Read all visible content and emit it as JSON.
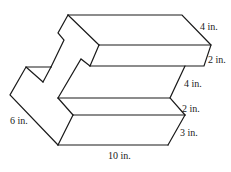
{
  "figure": {
    "labels": {
      "top_depth": "4 in.",
      "top_bar_height": "2 in.",
      "gap_height": "4 in.",
      "middle_ledge_height": "2 in.",
      "bottom_height": "3 in.",
      "left_depth": "6 in.",
      "bottom_length": "10 in."
    },
    "colors": {
      "stroke": "#1a1a1a",
      "background": "#ffffff"
    }
  }
}
